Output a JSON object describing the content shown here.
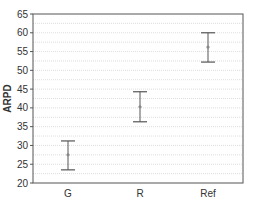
{
  "chart_data": {
    "type": "errorbar",
    "title": "",
    "xlabel": "",
    "ylabel": "ARPD",
    "ylim": [
      20,
      65
    ],
    "yticks": [
      20,
      25,
      30,
      35,
      40,
      45,
      50,
      55,
      60,
      65
    ],
    "grid": true,
    "categories": [
      "G",
      "R",
      "Ref"
    ],
    "values": [
      27.5,
      40.3,
      56.2
    ],
    "error_upper": [
      31.2,
      44.3,
      60.0
    ],
    "error_lower": [
      23.5,
      36.3,
      52.2
    ]
  },
  "colors": {
    "frame": "#555555",
    "grid": "#c8c8c8",
    "errorbar": "#555555",
    "marker": "#888888"
  }
}
